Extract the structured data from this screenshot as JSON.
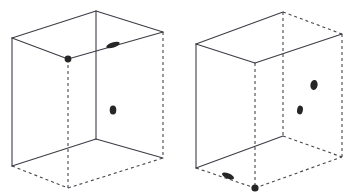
{
  "diagram": {
    "canvas": {
      "width": 356,
      "height": 196,
      "background": "#ffffff"
    },
    "style": {
      "solid_edge_color": "#3c3c46",
      "solid_edge_width": 1.1,
      "dashed_edge_color": "#46464f",
      "dashed_edge_width": 1.1,
      "dash_pattern": "3,3",
      "marker_color": "#262626"
    },
    "boxes": [
      {
        "id": "left-box",
        "label": "Left box",
        "vertices": {
          "front_top_left": {
            "x": 12,
            "y": 38
          },
          "front_top_right": {
            "x": 96,
            "y": 11
          },
          "front_bottom_left": {
            "x": 12,
            "y": 166
          },
          "front_bottom_right": {
            "x": 96,
            "y": 139
          },
          "back_top_left": {
            "x": 68,
            "y": 59
          },
          "back_top_right": {
            "x": 163,
            "y": 32
          },
          "back_bottom_left": {
            "x": 68,
            "y": 188
          },
          "back_bottom_right": {
            "x": 163,
            "y": 158
          }
        },
        "solid_edges": [
          "front_top_left-front_top_right",
          "front_top_left-front_bottom_left",
          "front_top_left-back_top_left",
          "front_top_right-front_bottom_right",
          "front_top_right-back_top_right",
          "front_bottom_left-front_bottom_right",
          "front_bottom_right-back_bottom_right",
          "back_top_left-back_top_right"
        ],
        "dashed_edges": [
          "back_top_left-back_bottom_left",
          "back_bottom_left-back_bottom_right",
          "back_top_right-back_bottom_right",
          "front_bottom_left-back_bottom_left"
        ],
        "markers": [
          {
            "name": "corner-dot",
            "x": 68,
            "y": 59,
            "rx": 3.4,
            "ry": 3.4,
            "rotation": 0
          },
          {
            "name": "dash-blob",
            "x": 113,
            "y": 45,
            "rx": 7.0,
            "ry": 2.6,
            "rotation": -18
          },
          {
            "name": "oval-blob",
            "x": 113,
            "y": 110,
            "rx": 3.3,
            "ry": 4.6,
            "rotation": 0
          }
        ]
      },
      {
        "id": "right-box",
        "label": "Right box",
        "vertices": {
          "front_top_left": {
            "x": 196,
            "y": 44
          },
          "front_top_right": {
            "x": 283,
            "y": 12
          },
          "front_bottom_left": {
            "x": 196,
            "y": 168
          },
          "front_bottom_right": {
            "x": 283,
            "y": 136
          },
          "back_top_left": {
            "x": 255,
            "y": 63
          },
          "back_top_right": {
            "x": 342,
            "y": 34
          },
          "back_bottom_left": {
            "x": 255,
            "y": 188
          },
          "back_bottom_right": {
            "x": 342,
            "y": 157
          }
        },
        "solid_edges": [
          "front_top_left-front_top_right",
          "front_top_left-front_bottom_left",
          "front_top_left-back_top_left",
          "front_bottom_left-front_bottom_right",
          "back_top_left-back_top_right"
        ],
        "dashed_edges": [
          "front_top_right-back_top_right",
          "front_top_right-front_bottom_right",
          "back_top_left-back_bottom_left",
          "back_top_right-back_bottom_right",
          "back_bottom_left-back_bottom_right",
          "front_bottom_left-back_bottom_left",
          "front_bottom_right-back_bottom_right"
        ],
        "markers": [
          {
            "name": "oval-blob-upper",
            "x": 314,
            "y": 85,
            "rx": 3.6,
            "ry": 5.0,
            "rotation": 10
          },
          {
            "name": "oval-blob-lower",
            "x": 300,
            "y": 110,
            "rx": 2.9,
            "ry": 4.4,
            "rotation": 10
          },
          {
            "name": "dash-blob-bottom",
            "x": 228,
            "y": 176,
            "rx": 6.4,
            "ry": 2.6,
            "rotation": 22
          },
          {
            "name": "corner-dot-bottom",
            "x": 255,
            "y": 188,
            "rx": 3.6,
            "ry": 3.6,
            "rotation": 0
          }
        ]
      }
    ]
  }
}
